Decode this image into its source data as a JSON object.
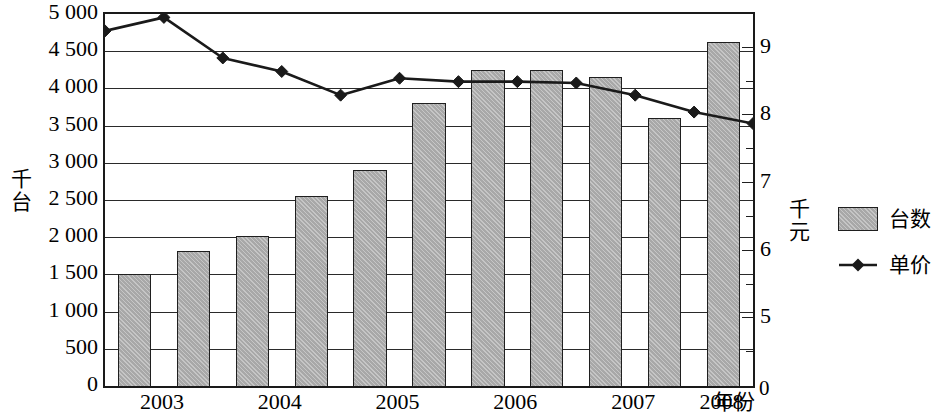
{
  "chart_data": {
    "type": "bar",
    "title": "",
    "subtitle": "",
    "xlabel": "年份",
    "ylabel": "千台",
    "y2label": "千元",
    "grid": true,
    "legend_position": "right",
    "x_tick_labels": [
      "2003",
      "2004",
      "2005",
      "2006",
      "2007",
      "2008"
    ],
    "x_semiannual_points": [
      "2003上",
      "2003下",
      "2004上",
      "2004下",
      "2005上",
      "2005下",
      "2006上",
      "2006下",
      "2007上",
      "2007下",
      "2008"
    ],
    "ylim": [
      0,
      5000
    ],
    "y_tick_labels": [
      "5 000",
      "4 500",
      "4 000",
      "3 500",
      "3 000",
      "2 500",
      "2 000",
      "1 500",
      "1 000",
      "500",
      "0"
    ],
    "y_ticks": [
      5000,
      4500,
      4000,
      3500,
      3000,
      2500,
      2000,
      1500,
      1000,
      500,
      0
    ],
    "y2lim": [
      4.0,
      9.5
    ],
    "y2_tick_labels": [
      "9",
      "8",
      "7",
      "6",
      "5",
      "0"
    ],
    "y2_ticks": [
      9,
      8,
      7,
      6,
      5,
      0
    ],
    "series": [
      {
        "name": "台数",
        "kind": "bar",
        "axis": "left",
        "color": "#a8a8a8",
        "edge_color": "#1f1f1f",
        "values": [
          1510,
          1810,
          2010,
          2550,
          2900,
          3800,
          4250,
          4250,
          4150,
          3600,
          4620
        ]
      },
      {
        "name": "单价",
        "kind": "line",
        "axis": "right",
        "color": "#1a1a1a",
        "marker": "diamond",
        "values": [
          9.25,
          9.45,
          8.85,
          8.65,
          8.3,
          8.55,
          8.5,
          8.5,
          8.48,
          8.3,
          8.05,
          7.88
        ]
      }
    ]
  },
  "legend": {
    "items": [
      {
        "label": "台数",
        "icon": "bar-swatch"
      },
      {
        "label": "单价",
        "icon": "line-diamond-swatch"
      }
    ]
  },
  "axes": {
    "left_title": "千台",
    "right_title": "千元",
    "x_name": "年份",
    "right_zero": "0"
  }
}
